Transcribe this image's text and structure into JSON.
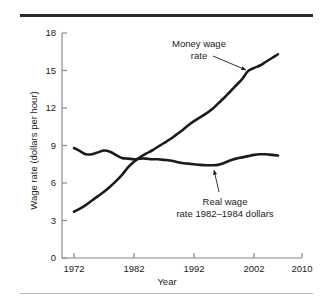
{
  "chart_data": {
    "type": "line",
    "title": "",
    "xlabel": "Year",
    "ylabel": "Wage rate (dollars per hour)",
    "xlim": [
      1970,
      2010
    ],
    "ylim": [
      0,
      18
    ],
    "xticks": [
      1972,
      1982,
      1992,
      2002,
      2010
    ],
    "xtick_labels": [
      "1972",
      "1982",
      "1992",
      "2002",
      "2010"
    ],
    "yticks": [
      0,
      3,
      6,
      9,
      12,
      15,
      18
    ],
    "ytick_labels": [
      "0",
      "3",
      "6",
      "9",
      "12",
      "15",
      "18"
    ],
    "grid": false,
    "legend": "annotations",
    "annotations": [
      {
        "name": "money-wage",
        "line1": "Money wage",
        "line2": "rate",
        "points_to": [
          2001.5,
          15.0
        ]
      },
      {
        "name": "real-wage",
        "line1": "Real wage",
        "line2": "rate 1982–1984 dollars",
        "points_to": [
          1996.0,
          7.45
        ]
      }
    ],
    "series": [
      {
        "name": "Money wage rate",
        "color": "#1b1b1b",
        "x": [
          1972,
          1973,
          1974,
          1975,
          1976,
          1977,
          1978,
          1979,
          1980,
          1981,
          1982,
          1983,
          1984,
          1985,
          1986,
          1987,
          1988,
          1989,
          1990,
          1991,
          1992,
          1993,
          1994,
          1995,
          1996,
          1997,
          1998,
          1999,
          2000,
          2001,
          2002,
          2003,
          2004,
          2005,
          2006
        ],
        "values": [
          3.7,
          3.95,
          4.25,
          4.6,
          4.95,
          5.3,
          5.7,
          6.15,
          6.65,
          7.25,
          7.7,
          8.05,
          8.35,
          8.6,
          8.9,
          9.2,
          9.5,
          9.85,
          10.2,
          10.6,
          10.95,
          11.25,
          11.55,
          11.9,
          12.35,
          12.8,
          13.3,
          13.8,
          14.3,
          14.95,
          15.2,
          15.4,
          15.7,
          16.0,
          16.3
        ]
      },
      {
        "name": "Real wage rate 1982–1984 dollars",
        "color": "#1b1b1b",
        "x": [
          1972,
          1973,
          1974,
          1975,
          1976,
          1977,
          1978,
          1979,
          1980,
          1981,
          1982,
          1983,
          1984,
          1985,
          1986,
          1987,
          1988,
          1989,
          1990,
          1991,
          1992,
          1993,
          1994,
          1995,
          1996,
          1997,
          1998,
          1999,
          2000,
          2001,
          2002,
          2003,
          2004,
          2005,
          2006
        ],
        "values": [
          8.8,
          8.55,
          8.3,
          8.3,
          8.45,
          8.6,
          8.5,
          8.25,
          8.0,
          7.95,
          7.9,
          7.95,
          7.95,
          7.9,
          7.9,
          7.85,
          7.8,
          7.7,
          7.6,
          7.55,
          7.5,
          7.45,
          7.42,
          7.42,
          7.45,
          7.6,
          7.8,
          7.95,
          8.05,
          8.15,
          8.25,
          8.3,
          8.3,
          8.25,
          8.2
        ]
      }
    ]
  }
}
